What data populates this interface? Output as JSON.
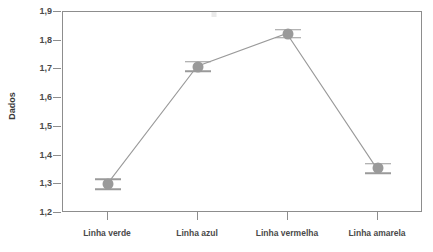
{
  "chart_data": {
    "type": "line",
    "title": "",
    "subtitle": "",
    "xlabel": "",
    "ylabel": "Dados",
    "categories": [
      "Linha verde",
      "Linha azul",
      "Linha vermelha",
      "Linha amarela"
    ],
    "values": [
      1.3,
      1.71,
      1.825,
      1.355
    ],
    "errors": [
      0.018,
      0.016,
      0.014,
      0.016
    ],
    "series": [
      {
        "name": "Dados",
        "values": [
          1.3,
          1.71,
          1.825,
          1.355
        ],
        "errors": [
          0.018,
          0.016,
          0.014,
          0.016
        ],
        "marker": "circle",
        "color": "#9a9a9a"
      }
    ],
    "ylim": [
      1.2,
      1.9
    ],
    "ytick_labels": [
      "1,9",
      "1,8",
      "1,7",
      "1,6",
      "1,5",
      "1,4",
      "1,3",
      "1,2"
    ],
    "ytick_values": [
      1.9,
      1.8,
      1.7,
      1.6,
      1.5,
      1.4,
      1.3,
      1.2
    ],
    "grid": false,
    "legend": "none",
    "decimal_separator": ",",
    "error_bar_style": "caps-only",
    "colors": {
      "marker": "#9a9a9a",
      "line": "#9a9a9a",
      "axis": "#8d8d8d",
      "text": "#4a4a4a",
      "background": "#ffffff"
    }
  }
}
